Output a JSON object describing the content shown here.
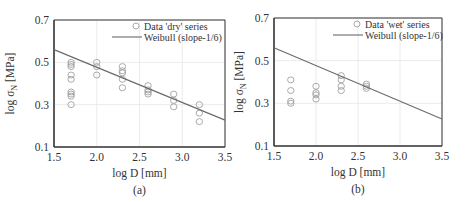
{
  "chart_data": [
    {
      "type": "scatter",
      "panel_label": "(a)",
      "xlabel": "log D [mm]",
      "ylabel": "log σN [MPa]",
      "ylabel_main": "log σ",
      "ylabel_sub": "N",
      "ylabel_unit": " [MPa]",
      "xlim": [
        1.5,
        3.5
      ],
      "ylim": [
        0.1,
        0.7
      ],
      "xticks": [
        "1.5",
        "2.0",
        "2.5",
        "3.0",
        "3.5"
      ],
      "yticks": [
        "0.1",
        "0.3",
        "0.5",
        "0.7"
      ],
      "grid": true,
      "legend_position": "upper right",
      "legend": [
        "Data 'dry' series",
        "Weibull (slope-1/6)"
      ],
      "series": [
        {
          "name": "Data 'dry' series",
          "marker": "open-circle",
          "points": [
            [
              1.7,
              0.5
            ],
            [
              1.7,
              0.49
            ],
            [
              1.7,
              0.48
            ],
            [
              1.7,
              0.44
            ],
            [
              1.7,
              0.42
            ],
            [
              1.7,
              0.36
            ],
            [
              1.7,
              0.35
            ],
            [
              1.7,
              0.34
            ],
            [
              1.7,
              0.3
            ],
            [
              2.0,
              0.5
            ],
            [
              2.0,
              0.48
            ],
            [
              2.0,
              0.44
            ],
            [
              2.3,
              0.48
            ],
            [
              2.3,
              0.46
            ],
            [
              2.3,
              0.45
            ],
            [
              2.3,
              0.42
            ],
            [
              2.3,
              0.38
            ],
            [
              2.6,
              0.39
            ],
            [
              2.6,
              0.37
            ],
            [
              2.6,
              0.36
            ],
            [
              2.6,
              0.35
            ],
            [
              2.9,
              0.35
            ],
            [
              2.9,
              0.32
            ],
            [
              2.9,
              0.29
            ],
            [
              3.2,
              0.3
            ],
            [
              3.2,
              0.26
            ],
            [
              3.2,
              0.22
            ]
          ]
        },
        {
          "name": "Weibull (slope-1/6)",
          "marker": "line",
          "points": [
            [
              1.5,
              0.56
            ],
            [
              3.5,
              0.227
            ]
          ]
        }
      ]
    },
    {
      "type": "scatter",
      "panel_label": "(b)",
      "xlabel": "log D [mm]",
      "ylabel": "log σN [MPa]",
      "ylabel_main": "log σ",
      "ylabel_sub": "N",
      "ylabel_unit": " [MPa]",
      "xlim": [
        1.5,
        3.5
      ],
      "ylim": [
        0.1,
        0.7
      ],
      "xticks": [
        "1.5",
        "2.0",
        "2.5",
        "3.0",
        "3.5"
      ],
      "yticks": [
        "0.1",
        "0.3",
        "0.5",
        "0.7"
      ],
      "grid": true,
      "legend_position": "upper right",
      "legend": [
        "Data 'wet' series",
        "Weibull (slope-1/6)"
      ],
      "series": [
        {
          "name": "Data 'wet' series",
          "marker": "open-circle",
          "points": [
            [
              1.7,
              0.41
            ],
            [
              1.7,
              0.36
            ],
            [
              1.7,
              0.31
            ],
            [
              1.7,
              0.3
            ],
            [
              2.0,
              0.38
            ],
            [
              2.0,
              0.35
            ],
            [
              2.0,
              0.34
            ],
            [
              2.0,
              0.32
            ],
            [
              2.3,
              0.43
            ],
            [
              2.3,
              0.41
            ],
            [
              2.3,
              0.38
            ],
            [
              2.3,
              0.36
            ],
            [
              2.6,
              0.39
            ],
            [
              2.6,
              0.38
            ],
            [
              2.6,
              0.37
            ]
          ]
        },
        {
          "name": "Weibull (slope-1/6)",
          "marker": "line",
          "points": [
            [
              1.5,
              0.56
            ],
            [
              3.5,
              0.227
            ]
          ]
        }
      ]
    }
  ],
  "colors": {
    "axis": "#3a3a3a",
    "grid": "#e6e6e6",
    "line": "#6a6a6a",
    "marker": "#a0a0a0",
    "text": "#333333"
  }
}
